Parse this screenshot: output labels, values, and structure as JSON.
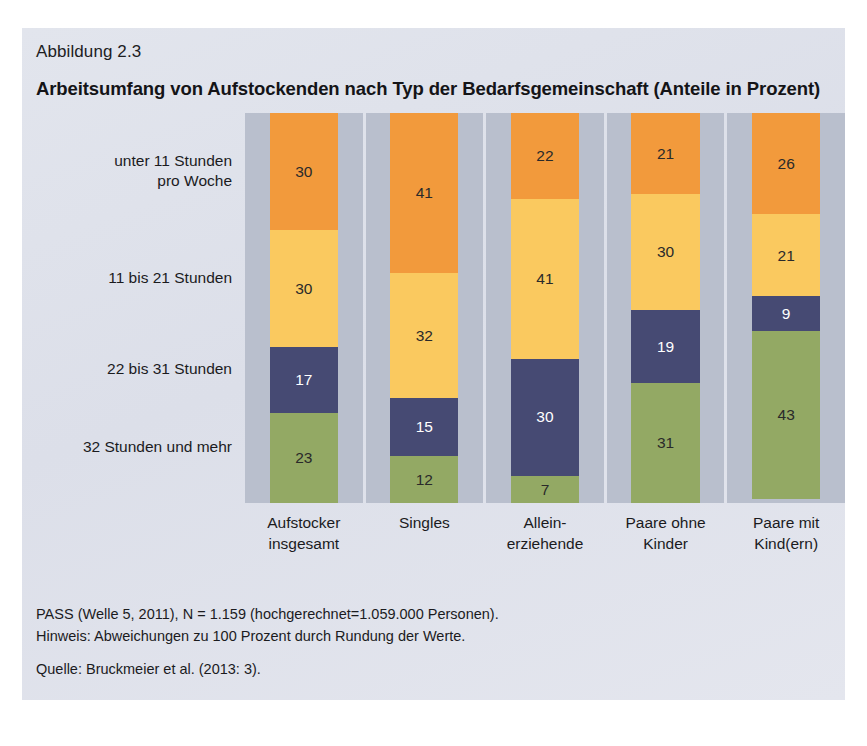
{
  "figure": {
    "number": "Abbildung 2.3",
    "title": "Arbeitsumfang von Aufstockenden nach Typ der Bedarfsgemeinschaft (Anteile in Prozent)",
    "background_color": "#dfe3ec",
    "panel_background_color": "#b9bfcd"
  },
  "footnotes": {
    "line1": "PASS (Welle 5, 2011), N = 1.159 (hochgerechnet=1.059.000 Personen).",
    "line2": "Hinweis: Abweichungen zu 100 Prozent durch Rundung der Werte.",
    "source": "Quelle: Bruckmeier et al. (2013: 3)."
  },
  "chart_data": {
    "type": "bar",
    "subtype": "stacked-100-percent",
    "orientation": "vertical",
    "title": "Arbeitsumfang von Aufstockenden nach Typ der Bedarfsgemeinschaft (Anteile in Prozent)",
    "xlabel": "",
    "ylabel": "",
    "ylim": [
      0,
      100
    ],
    "grid": false,
    "legend_position": "left-axis-labels",
    "categories": [
      "Aufstocker\ninsgesamt",
      "Singles",
      "Allein-\nerziehende",
      "Paare ohne\nKinder",
      "Paare mit\nKind(ern)"
    ],
    "series": [
      {
        "name": "unter 11 Stunden\npro Woche",
        "color": "#f29a3c",
        "label_color": "#2a2a2a",
        "values": [
          30,
          41,
          22,
          21,
          26
        ]
      },
      {
        "name": "11 bis 21 Stunden",
        "color": "#fac95f",
        "label_color": "#2a2a2a",
        "values": [
          30,
          32,
          41,
          30,
          21
        ]
      },
      {
        "name": "22 bis 31 Stunden",
        "color": "#464a73",
        "label_color": "#ffffff",
        "values": [
          17,
          15,
          30,
          19,
          9
        ]
      },
      {
        "name": "32 Stunden und mehr",
        "color": "#93a964",
        "label_color": "#2a2a2a",
        "values": [
          23,
          12,
          7,
          31,
          43
        ]
      }
    ]
  }
}
